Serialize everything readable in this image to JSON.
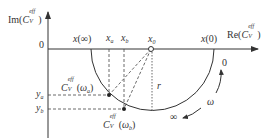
{
  "diagram": {
    "type": "nyquist-semicircle-plot",
    "axes": {
      "y_axis_label": {
        "prefix": "Im(",
        "var": "C",
        "sub": "V",
        "sup": "eff",
        "suffix": ")"
      },
      "x_axis_label": {
        "prefix": "Re(",
        "var": "C",
        "sub": "V",
        "sup": "eff",
        "suffix": ")"
      },
      "origin_label": "0"
    },
    "axis_points": {
      "x_inf": {
        "var": "x",
        "arg": "(∞)"
      },
      "x_a": {
        "var": "x",
        "sub": "a"
      },
      "x_b": {
        "var": "x",
        "sub": "b"
      },
      "x_0": {
        "var": "x",
        "sub": "0"
      },
      "x_zero": {
        "var": "x",
        "arg": "(0)"
      }
    },
    "curve_points": {
      "a": {
        "var": "C",
        "sub": "V",
        "sup": "eff",
        "arg_open": "(",
        "omega": "ω",
        "omega_sub": "a",
        "arg_close": ")"
      },
      "b": {
        "var": "C",
        "sub": "V",
        "sup": "eff",
        "arg_open": "(",
        "omega": "ω",
        "omega_sub": "b",
        "arg_close": ")"
      }
    },
    "y_ticks": {
      "y_a": {
        "var": "y",
        "sub": "a"
      },
      "y_b": {
        "var": "y",
        "sub": "b"
      }
    },
    "radius_label": "r",
    "frequency_annotations": {
      "start": "0",
      "omega": "ω",
      "end": "∞"
    },
    "colors": {
      "line": "#333333",
      "dashed": "#444444",
      "background": "#ffffff"
    }
  }
}
